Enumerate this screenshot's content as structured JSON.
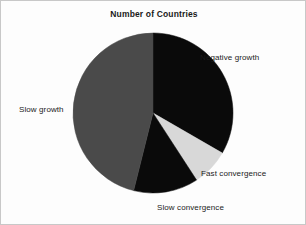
{
  "chart_data": {
    "type": "pie",
    "title": "Number of Countries",
    "xlabel": "",
    "ylabel": "",
    "legend_position": "none",
    "grid": false,
    "start_angle_deg": 0,
    "direction": "clockwise",
    "categories": [
      "Negative growth",
      "Fast convergence",
      "Slow convergence",
      "Slow growth"
    ],
    "values": [
      33.3,
      7.5,
      13.1,
      46.1
    ],
    "units": "percent of countries",
    "slices": [
      {
        "label": "Negative growth",
        "value": 33.3,
        "color": "#0a0a0a",
        "start_deg": 0,
        "end_deg": 120,
        "label_position": "right"
      },
      {
        "label": "Fast convergence",
        "value": 7.5,
        "color": "#d8d8d8",
        "start_deg": 120,
        "end_deg": 147,
        "label_position": "bottom-right"
      },
      {
        "label": "Slow convergence",
        "value": 13.1,
        "color": "#0a0a0a",
        "start_deg": 147,
        "end_deg": 194,
        "label_position": "bottom"
      },
      {
        "label": "Slow growth",
        "value": 46.1,
        "color": "#4a4a4a",
        "start_deg": 194,
        "end_deg": 360,
        "label_position": "left"
      }
    ]
  },
  "colors": {
    "black_slice": "#0a0a0a",
    "dark_gray_slice": "#4a4a4a",
    "light_gray_slice": "#d8d8d8",
    "background": "#fdfdfd",
    "border": "#c8c8c8",
    "text": "#1a1a1a"
  }
}
